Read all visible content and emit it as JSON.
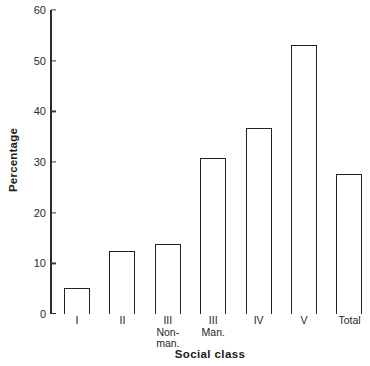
{
  "chart_data": {
    "type": "bar",
    "title": "",
    "xlabel": "Social class",
    "ylabel": "Percentage",
    "ylim": [
      0,
      60
    ],
    "yticks": [
      0,
      10,
      20,
      30,
      40,
      50,
      60
    ],
    "grid": false,
    "legend": false,
    "categories": [
      "I",
      "II",
      "III Non-man.",
      "III Man.",
      "IV",
      "V",
      "Total"
    ],
    "values": [
      5.2,
      12.4,
      13.8,
      30.8,
      36.8,
      53.0,
      27.6
    ],
    "bar_style": {
      "fill": "#ffffff",
      "edge": "#222222"
    }
  },
  "axes": {
    "y": {
      "label": "Percentage",
      "ticks": [
        {
          "value": 60,
          "text": "60"
        },
        {
          "value": 50,
          "text": "50"
        },
        {
          "value": 40,
          "text": "40"
        },
        {
          "value": 30,
          "text": "30"
        },
        {
          "value": 20,
          "text": "20"
        },
        {
          "value": 10,
          "text": "10"
        },
        {
          "value": 0,
          "text": "0"
        }
      ]
    },
    "x": {
      "label": "Social class",
      "ticks": [
        {
          "line1": "I",
          "line2": "",
          "line3": ""
        },
        {
          "line1": "II",
          "line2": "",
          "line3": ""
        },
        {
          "line1": "III",
          "line2": "Non-",
          "line3": "man."
        },
        {
          "line1": "III",
          "line2": "Man.",
          "line3": ""
        },
        {
          "line1": "IV",
          "line2": "",
          "line3": ""
        },
        {
          "line1": "V",
          "line2": "",
          "line3": ""
        },
        {
          "line1": "Total",
          "line2": "",
          "line3": ""
        }
      ]
    }
  }
}
